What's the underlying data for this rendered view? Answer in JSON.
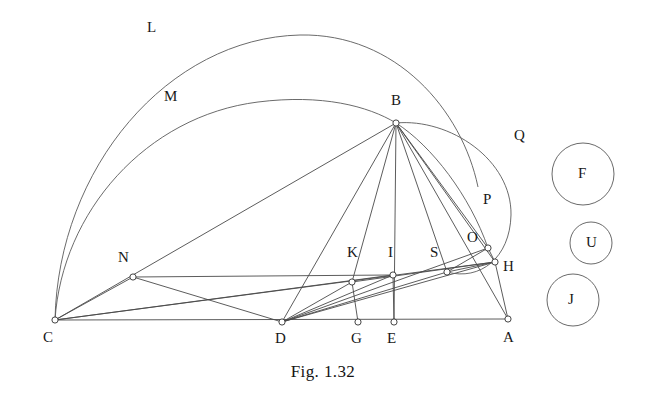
{
  "figure": {
    "caption": "Fig. 1.32",
    "stroke_color": "#4a4a4a",
    "arc_color": "#5a5a5a",
    "circle_color": "#6a6a6a",
    "background": "#ffffff"
  },
  "points": [
    {
      "id": "A",
      "label": "A",
      "x": 508,
      "y": 319,
      "lx": 503,
      "ly": 330,
      "marker": true
    },
    {
      "id": "B",
      "label": "B",
      "x": 396,
      "y": 123,
      "lx": 391,
      "ly": 93,
      "marker": true
    },
    {
      "id": "C",
      "label": "C",
      "x": 55,
      "y": 320,
      "lx": 43,
      "ly": 330,
      "marker": true
    },
    {
      "id": "D",
      "label": "D",
      "x": 282,
      "y": 322,
      "lx": 275,
      "ly": 331,
      "marker": true
    },
    {
      "id": "E",
      "label": "E",
      "x": 394,
      "y": 322,
      "lx": 387,
      "ly": 331,
      "marker": true
    },
    {
      "id": "G",
      "label": "G",
      "x": 358,
      "y": 322,
      "lx": 351,
      "ly": 331,
      "marker": true
    },
    {
      "id": "H",
      "label": "H",
      "x": 495,
      "y": 262,
      "lx": 503,
      "ly": 259,
      "marker": true
    },
    {
      "id": "I",
      "label": "I",
      "x": 393,
      "y": 275,
      "lx": 388,
      "ly": 245,
      "marker": true
    },
    {
      "id": "K",
      "label": "K",
      "x": 352,
      "y": 282,
      "lx": 347,
      "ly": 245,
      "marker": true
    },
    {
      "id": "N",
      "label": "N",
      "x": 133,
      "y": 277,
      "lx": 118,
      "ly": 250,
      "marker": true
    },
    {
      "id": "O",
      "label": "O",
      "x": 488,
      "y": 248,
      "lx": 467,
      "ly": 230,
      "marker": true
    },
    {
      "id": "S",
      "label": "S",
      "x": 447,
      "y": 272,
      "lx": 430,
      "ly": 245,
      "marker": true
    }
  ],
  "arc_labels": [
    {
      "id": "L",
      "label": "L",
      "lx": 147,
      "ly": 20
    },
    {
      "id": "M",
      "label": "M",
      "lx": 164,
      "ly": 89
    },
    {
      "id": "Q",
      "label": "Q",
      "lx": 514,
      "ly": 128
    },
    {
      "id": "P",
      "label": "P",
      "lx": 483,
      "ly": 192
    }
  ],
  "free_circles": [
    {
      "id": "F",
      "label": "F",
      "cx": 583,
      "cy": 174,
      "r": 31
    },
    {
      "id": "U",
      "label": "U",
      "cx": 591,
      "cy": 243,
      "r": 21
    },
    {
      "id": "J",
      "label": "J",
      "cx": 573,
      "cy": 300,
      "r": 26
    }
  ],
  "segments": [
    {
      "from": "C",
      "to": "A",
      "name": "segment-C-A"
    },
    {
      "from": "C",
      "to": "B",
      "name": "segment-C-B"
    },
    {
      "from": "C",
      "to": "N",
      "name": "segment-C-N"
    },
    {
      "from": "C",
      "to": "H",
      "name": "segment-C-H"
    },
    {
      "from": "C",
      "to": "I",
      "name": "segment-C-I"
    },
    {
      "from": "N",
      "to": "I",
      "name": "segment-N-I"
    },
    {
      "from": "N",
      "to": "D",
      "name": "segment-N-D"
    },
    {
      "from": "B",
      "to": "D",
      "name": "segment-B-D"
    },
    {
      "from": "B",
      "to": "E",
      "name": "segment-B-E"
    },
    {
      "from": "B",
      "to": "K",
      "name": "segment-B-K"
    },
    {
      "from": "B",
      "to": "S",
      "name": "segment-B-S"
    },
    {
      "from": "B",
      "to": "O",
      "name": "segment-B-O"
    },
    {
      "from": "B",
      "to": "H",
      "name": "segment-B-H"
    },
    {
      "from": "B",
      "to": "A",
      "name": "segment-B-A"
    },
    {
      "from": "D",
      "to": "K",
      "name": "segment-D-K"
    },
    {
      "from": "D",
      "to": "I",
      "name": "segment-D-I"
    },
    {
      "from": "D",
      "to": "S",
      "name": "segment-D-S"
    },
    {
      "from": "D",
      "to": "O",
      "name": "segment-D-O"
    },
    {
      "from": "D",
      "to": "H",
      "name": "segment-D-H"
    },
    {
      "from": "K",
      "to": "G",
      "name": "segment-K-G"
    },
    {
      "from": "I",
      "to": "E",
      "name": "segment-I-E"
    },
    {
      "from": "S",
      "to": "H",
      "name": "segment-S-H"
    },
    {
      "from": "O",
      "to": "H",
      "name": "segment-O-H"
    },
    {
      "from": "H",
      "to": "A",
      "name": "segment-H-A"
    },
    {
      "from": "K",
      "to": "H",
      "name": "segment-K-H"
    },
    {
      "from": "S",
      "to": "O",
      "name": "segment-S-O"
    }
  ],
  "arcs": [
    {
      "id": "L",
      "name": "arc-L",
      "d": "M 55 320 C 58 168 168 38 300 35 C 396 33 462 110 478 187"
    },
    {
      "id": "M",
      "name": "arc-M",
      "d": "M 55 320 C 62 212 146 116 258 102 C 322 94 368 106 396 123"
    },
    {
      "id": "Q",
      "name": "arc-Q",
      "d": "M 396 123 C 450 118 512 160 511 215 C 510 258 480 281 447 272"
    },
    {
      "id": "P",
      "name": "arc-P",
      "d": "M 396 123 C 432 146 470 196 488 248"
    }
  ]
}
